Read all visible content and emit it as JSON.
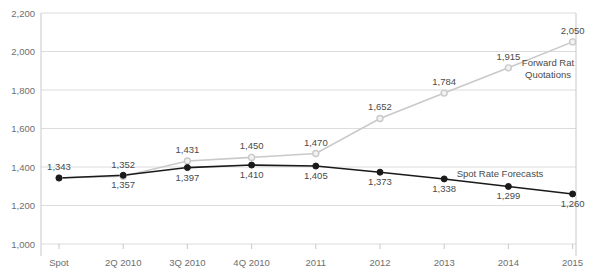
{
  "chart_data": {
    "type": "line",
    "title": "",
    "xlabel": "",
    "ylabel": "",
    "categories": [
      "Spot",
      "2Q 2010",
      "3Q 2010",
      "4Q 2010",
      "2011",
      "2012",
      "2013",
      "2014",
      "2015"
    ],
    "ylim": [
      1000,
      2200
    ],
    "yticks": [
      "1,000",
      "1,200",
      "1,400",
      "1,600",
      "1,800",
      "2,000",
      "2,200"
    ],
    "ytick_values": [
      1000,
      1200,
      1400,
      1600,
      1800,
      2000,
      2200
    ],
    "grid": true,
    "legend_position": "inline-right",
    "series": [
      {
        "name": "Forward Rat Quotations",
        "color": "#c9c9c9",
        "marker": "open-circle",
        "label_position": "above",
        "values": [
          1343,
          1352,
          1431,
          1450,
          1470,
          1652,
          1784,
          1915,
          2050
        ],
        "value_labels": [
          "1,343",
          "1,352",
          "1,431",
          "1,450",
          "1,470",
          "1,652",
          "1,784",
          "1,915",
          "2,050"
        ]
      },
      {
        "name": "Spot Rate Forecasts",
        "color": "#1a1a1a",
        "marker": "filled-circle",
        "label_position": "below",
        "values": [
          1343,
          1357,
          1397,
          1410,
          1405,
          1373,
          1338,
          1299,
          1260
        ],
        "value_labels": [
          "1,343",
          "1,357",
          "1,397",
          "1,410",
          "1,405",
          "1,373",
          "1,338",
          "1,299",
          "1,260"
        ]
      }
    ],
    "annotations": [
      {
        "text": "Forward Rat",
        "x": 548,
        "y": 66
      },
      {
        "text": "Quotations",
        "x": 548,
        "y": 78
      },
      {
        "text": "Spot Rate Forecasts",
        "x": 500,
        "y": 177
      }
    ]
  }
}
